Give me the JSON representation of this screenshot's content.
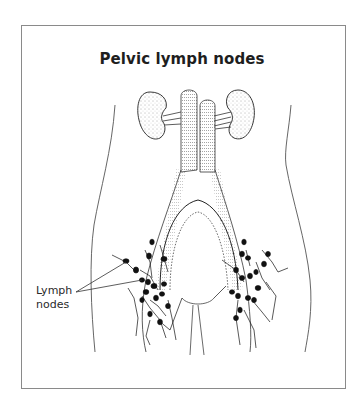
{
  "figure": {
    "title": "Pelvic lymph nodes",
    "labels": [
      {
        "line1": "Lymph",
        "line2": "nodes"
      }
    ],
    "structures": [
      "kidney-left",
      "kidney-right",
      "inferior-vena-cava",
      "aorta",
      "iliac-vessels",
      "bladder",
      "urethra",
      "lymph-node-clusters",
      "body-outline"
    ],
    "colors": {
      "ink": "#1e1e1e",
      "frame": "#8a8a8a",
      "background": "#ffffff"
    }
  }
}
